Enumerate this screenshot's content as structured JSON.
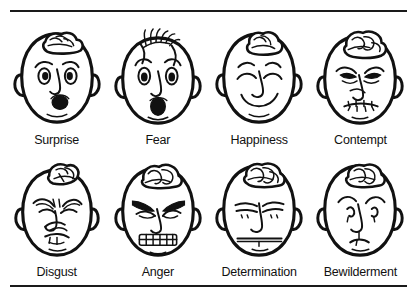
{
  "figure": {
    "background_color": "#ffffff",
    "ink_color": "#111111",
    "rule_top": "horizontal-rule",
    "rule_bottom": "horizontal-rule",
    "columns": 4,
    "rows": 2
  },
  "faces": [
    {
      "id": "surprise",
      "label": "Surprise",
      "row": 1,
      "column": 1,
      "icon": "cartoon-face-surprise",
      "features": "raised arched eyebrows, wide round eyes, open oval mouth, curl of hair on top"
    },
    {
      "id": "fear",
      "label": "Fear",
      "row": 1,
      "column": 2,
      "icon": "cartoon-face-fear",
      "features": "hair standing on end, high arched brows, wide staring eyes, open gaping mouth"
    },
    {
      "id": "happiness",
      "label": "Happiness",
      "row": 1,
      "column": 3,
      "icon": "cartoon-face-happiness",
      "features": "smiling crescent eyes, relaxed brows, broad upward smile, curly hair tuft"
    },
    {
      "id": "contempt",
      "label": "Contempt",
      "row": 1,
      "column": 4,
      "icon": "cartoon-face-contempt",
      "features": "lowered drawn brows, narrowed eyes, wrinkled nose, tight sneering mouth"
    },
    {
      "id": "disgust",
      "label": "Disgust",
      "row": 2,
      "column": 1,
      "icon": "cartoon-face-disgust",
      "features": "furrowed brow, squinted eyes, wrinkled raised nose, curled lip"
    },
    {
      "id": "anger",
      "label": "Anger",
      "row": 2,
      "column": 2,
      "icon": "cartoon-face-anger",
      "features": "heavy slanted brows, glaring eyes, bared clenched teeth"
    },
    {
      "id": "determination",
      "label": "Determination",
      "row": 2,
      "column": 3,
      "icon": "cartoon-face-determination",
      "features": "level lowered brows, steady eyes, straight firm mouth"
    },
    {
      "id": "bewilderment",
      "label": "Bewilderment",
      "row": 2,
      "column": 4,
      "icon": "cartoon-face-bewilderment",
      "features": "one raised eyebrow, uneven eyes, small puzzled downturned mouth"
    }
  ]
}
